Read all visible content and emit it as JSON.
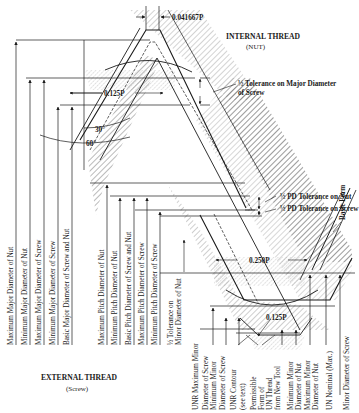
{
  "title_internal": "INTERNAL THREAD",
  "subtitle_internal": "(NUT)",
  "title_external": "EXTERNAL THREAD",
  "subtitle_external": "(Screw)",
  "dimensions": {
    "crest_flat": "0.041667P",
    "nut_root_width": "0.125P",
    "screw_root_width": "0.250P",
    "screw_root_radius": "0.125P",
    "half_angle": "30°",
    "thread_angle": "60°"
  },
  "callouts": {
    "half_tol_major_screw_line1": "½ Tolerance on Major Diameter",
    "half_tol_major_screw_line2": "of Screw",
    "half_pd_tol_nut": "½ PD Tolerance on Nut",
    "half_pd_tol_screw": "½ PD Tolerance on Screw",
    "basic_form": "Basic Form"
  },
  "vertical_labels": {
    "major": [
      "Maximum Major Diameter of Nut",
      "Minimum Major Diameter of Nut",
      "Maximum Major Diameter of Screw",
      "Minimum Major Diameter of Screw",
      "Basic Major Diameter of Screw and Nut"
    ],
    "pitch": [
      "Maximum Pitch Diameter of Nut",
      "Minimum Pitch Diameter of Nut",
      "Basic Pitch Diameter of Screw and Nut",
      "Maximum Pitch Diameter of Screw",
      "Minimum Pitch Diameter of Screw"
    ],
    "half_tol_minor_nut": [
      "½ Tolerance on",
      "Minor Diameter of Nut"
    ],
    "minor": [
      [
        "UNR Maximum Minor"
      ],
      [
        "Diameter of Screw",
        "Minimum Minor"
      ],
      [
        "Diameter of Screw"
      ],
      [
        "UNR Contour",
        "(see text)"
      ],
      [
        "Permissible",
        "Form of",
        "UN Thread",
        "from New Tool"
      ],
      [
        "Minimum Minor",
        "Diameter of Nut"
      ],
      [
        "Maximum Minor",
        "Diameter of Nut"
      ],
      [
        "UN Nominal (Max.)"
      ],
      [
        "Minor Diameter of Screw"
      ]
    ]
  }
}
